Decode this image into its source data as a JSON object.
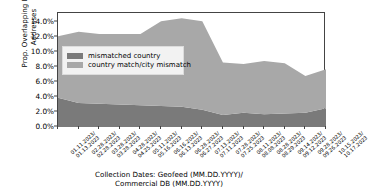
{
  "chart_data": {
    "type": "area",
    "stacked": true,
    "title": "",
    "xlabel": "Collection Dates: Geofeed (MM.DD.YYYY)/ Commercial DB (MM.DD.YYYY)",
    "ylabel": "Prop. Overlapping IPv4 Addresses",
    "ylim": [
      0,
      15.2
    ],
    "ytick_labels": [
      "0.0%",
      "2.0%",
      "4.0%",
      "6.0%",
      "8.0%",
      "10.0%",
      "12.0%",
      "14.0%"
    ],
    "ytick_values": [
      0,
      2,
      4,
      6,
      8,
      10,
      12,
      14
    ],
    "grid": false,
    "legend_position": "upper-left-inside",
    "categories": [
      "01.11.2023/\n01.13.2023",
      "02.28.2023/\n02.28.2023",
      "03.28.2023/\n03.28.2023",
      "04.28.2023/\n04.25.2023",
      "05.11.2023/\n05.16.2023",
      "06.16.2023/\n06.13.2023",
      "06.28.2023/\n06.27.2023",
      "07.13.2023/\n07.11.2023",
      "07.28.2023/\n07.25.2023",
      "08.11.2023/\n08.08.2023",
      "08.28.2023/\n08.29.2023",
      "09.14.2023/\n09.12.2023",
      "09.28.2023/\n09.26.2023",
      "10.15.2023/\n10.17.2023"
    ],
    "categories_lines": [
      [
        "01.11.2023/",
        "01.13.2023"
      ],
      [
        "02.28.2023/",
        "02.28.2023"
      ],
      [
        "03.28.2023/",
        "03.28.2023"
      ],
      [
        "04.28.2023/",
        "04.25.2023"
      ],
      [
        "05.11.2023/",
        "05.16.2023"
      ],
      [
        "06.16.2023/",
        "06.13.2023"
      ],
      [
        "06.28.2023/",
        "06.27.2023"
      ],
      [
        "07.13.2023/",
        "07.11.2023"
      ],
      [
        "07.28.2023/",
        "07.25.2023"
      ],
      [
        "08.11.2023/",
        "08.08.2023"
      ],
      [
        "08.28.2023/",
        "08.29.2023"
      ],
      [
        "09.14.2023/",
        "09.12.2023"
      ],
      [
        "09.28.2023/",
        "09.26.2023"
      ],
      [
        "10.15.2023/",
        "10.17.2023"
      ]
    ],
    "series": [
      {
        "name": "mismatched country",
        "color": "#7a7a7a",
        "values": [
          3.9,
          3.2,
          3.1,
          3.0,
          2.9,
          2.8,
          2.7,
          2.3,
          1.6,
          1.9,
          1.7,
          1.8,
          1.9,
          2.5
        ]
      },
      {
        "name": "country match/city mismatch",
        "color": "#a8a8a8",
        "values": [
          8.2,
          9.5,
          9.3,
          9.4,
          9.5,
          11.3,
          11.8,
          11.8,
          7.0,
          6.5,
          7.1,
          6.7,
          4.9,
          5.2
        ]
      }
    ],
    "totals": [
      12.1,
      12.7,
      12.4,
      12.4,
      12.4,
      14.1,
      14.5,
      14.1,
      8.6,
      8.4,
      8.8,
      8.5,
      6.8,
      7.7
    ]
  },
  "legend": {
    "items": [
      {
        "label": "mismatched country",
        "color": "#7a7a7a"
      },
      {
        "label": "country match/city mismatch",
        "color": "#a8a8a8"
      }
    ]
  },
  "axes": {
    "y_title": "Prop. Overlapping IPv4 Addresses",
    "x_title_line1": "Collection Dates: Geofeed (MM.DD.YYYY)/",
    "x_title_line2": "Commercial DB (MM.DD.YYYY)"
  }
}
